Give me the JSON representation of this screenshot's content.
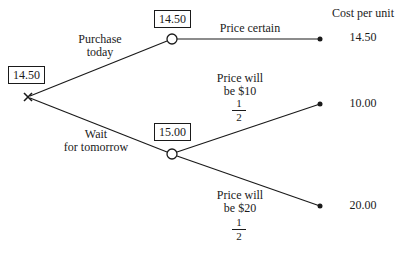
{
  "diagram": {
    "type": "decision-tree",
    "header": {
      "cost_column_label": "Cost per unit"
    },
    "decision_node": {
      "symbol": "×",
      "value": "14.50"
    },
    "branches": {
      "purchase_today": {
        "label_line1": "Purchase",
        "label_line2": "today",
        "node_value": "14.50",
        "outcomes": [
          {
            "label": "Price certain",
            "cost": "14.50"
          }
        ]
      },
      "wait": {
        "label_line1": "Wait",
        "label_line2": "for tomorrow",
        "node_value": "15.00",
        "outcomes": [
          {
            "label_line1": "Price will",
            "label_line2": "be $10",
            "prob_num": "1",
            "prob_den": "2",
            "cost": "10.00"
          },
          {
            "label_line1": "Price will",
            "label_line2": "be $20",
            "prob_num": "1",
            "prob_den": "2",
            "cost": "20.00"
          }
        ]
      }
    },
    "colors": {
      "ink": "#1a1a1a",
      "background": "#ffffff"
    }
  }
}
